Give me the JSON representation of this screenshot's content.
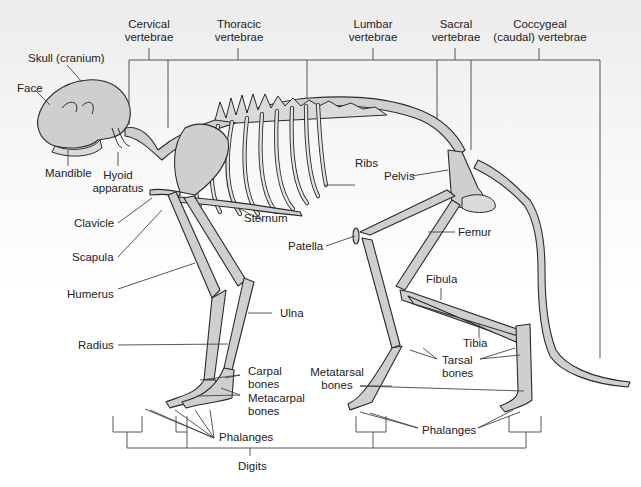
{
  "diagram": {
    "colors": {
      "bone_fill": "#cfcfcf",
      "outline": "#2a2a2a",
      "leader_line": "#444444",
      "label_text": "#222222"
    },
    "labels": {
      "cervical_l1": "Cervical",
      "cervical_l2": "vertebrae",
      "thoracic_l1": "Thoracic",
      "thoracic_l2": "vertebrae",
      "lumbar_l1": "Lumbar",
      "lumbar_l2": "vertebrae",
      "sacral_l1": "Sacral",
      "sacral_l2": "vertebrae",
      "coccygeal_l1": "Coccygeal",
      "coccygeal_l2": "(caudal) vertebrae",
      "skull": "Skull (cranium)",
      "face": "Face",
      "mandible": "Mandible",
      "hyoid_l1": "Hyoid",
      "hyoid_l2": "apparatus",
      "clavicle": "Clavicle",
      "scapula": "Scapula",
      "humerus": "Humerus",
      "radius": "Radius",
      "ulna": "Ulna",
      "sternum": "Sternum",
      "ribs": "Ribs",
      "pelvis": "Pelvis",
      "patella": "Patella",
      "femur": "Femur",
      "fibula": "Fibula",
      "tibia": "Tibia",
      "carpal_l1": "Carpal",
      "carpal_l2": "bones",
      "metacarpal_l1": "Metacarpal",
      "metacarpal_l2": "bones",
      "metatarsal_l1": "Metatarsal",
      "metatarsal_l2": "bones",
      "tarsal_l1": "Tarsal",
      "tarsal_l2": "bones",
      "phalanges_front": "Phalanges",
      "phalanges_hind": "Phalanges",
      "digits": "Digits"
    }
  }
}
